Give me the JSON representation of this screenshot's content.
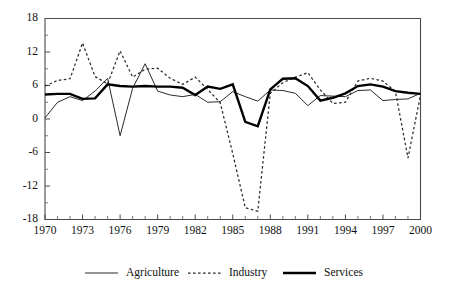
{
  "chart_data": {
    "type": "line",
    "title": "",
    "subtitle": "",
    "xlabel": "",
    "ylabel": "",
    "xlim": [
      1970,
      2000
    ],
    "ylim": [
      -18,
      18
    ],
    "grid": false,
    "legend_position": "bottom",
    "y_ticks": [
      18,
      12,
      6,
      0,
      -6,
      -12,
      -18
    ],
    "y_tick_labels": [
      "18",
      "12",
      "6",
      "0",
      "-6",
      "-12",
      "-18"
    ],
    "y_minor_tick_step": 3,
    "x_ticks": [
      1970,
      1971,
      1972,
      1973,
      1974,
      1975,
      1976,
      1977,
      1978,
      1979,
      1980,
      1981,
      1982,
      1983,
      1984,
      1985,
      1986,
      1987,
      1988,
      1989,
      1990,
      1991,
      1992,
      1993,
      1994,
      1995,
      1996,
      1997,
      1998,
      1999,
      2000
    ],
    "x_tick_labels_shown": [
      "1970",
      "1973",
      "1976",
      "1979",
      "1982",
      "1985",
      "1988",
      "1991",
      "1994",
      "1997",
      "2000"
    ],
    "x": [
      1970,
      1971,
      1972,
      1973,
      1974,
      1975,
      1976,
      1977,
      1978,
      1979,
      1980,
      1981,
      1982,
      1983,
      1984,
      1985,
      1986,
      1987,
      1988,
      1989,
      1990,
      1991,
      1992,
      1993,
      1994,
      1995,
      1996,
      1997,
      1998,
      1999,
      2000
    ],
    "series": [
      {
        "name": "Agriculture",
        "style": "thin-solid",
        "color": "#2b2b2b",
        "values": [
          0.2,
          3.0,
          4.0,
          3.3,
          5.0,
          7.3,
          -3.0,
          5.5,
          9.9,
          5.0,
          4.3,
          4.0,
          4.4,
          3.0,
          3.1,
          4.9,
          4.0,
          3.2,
          5.2,
          5.1,
          4.6,
          2.4,
          4.2,
          4.1,
          4.0,
          5.1,
          5.2,
          3.3,
          3.5,
          3.6,
          4.6
        ]
      },
      {
        "name": "Industry",
        "style": "dashed",
        "color": "#2b2b2b",
        "values": [
          5.9,
          6.9,
          7.2,
          13.6,
          7.6,
          6.3,
          12.2,
          7.5,
          8.9,
          9.1,
          7.3,
          6.2,
          7.5,
          5.3,
          2.9,
          -6.2,
          -15.9,
          -16.5,
          4.6,
          6.5,
          7.5,
          8.3,
          5.2,
          2.8,
          3.0,
          6.8,
          7.3,
          6.8,
          4.9,
          -7.0,
          4.3
        ]
      },
      {
        "name": "Services",
        "style": "thick-solid",
        "color": "#000000",
        "values": [
          4.4,
          4.5,
          4.5,
          3.6,
          3.7,
          6.2,
          5.9,
          5.8,
          5.9,
          5.8,
          5.8,
          5.6,
          4.3,
          5.8,
          5.4,
          6.2,
          -0.5,
          -1.3,
          5.3,
          7.2,
          7.3,
          5.9,
          3.3,
          3.8,
          4.6,
          5.9,
          6.2,
          5.8,
          5.0,
          4.7,
          4.5
        ]
      }
    ]
  },
  "legend": {
    "items": [
      {
        "label": "Agriculture",
        "style": "thin-solid"
      },
      {
        "label": "Industry",
        "style": "dashed"
      },
      {
        "label": "Services",
        "style": "thick-solid"
      }
    ]
  }
}
